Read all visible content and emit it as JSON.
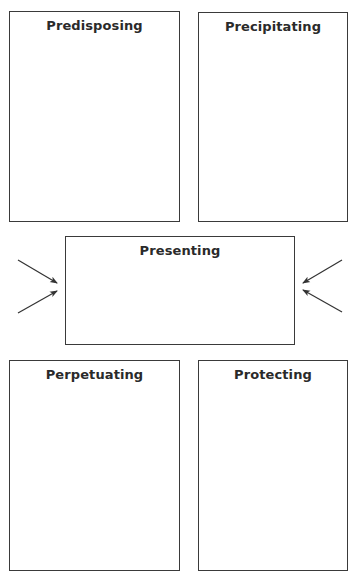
{
  "diagram": {
    "type": "5P formulation",
    "boxes": [
      {
        "id": "predisposing",
        "title": "Predisposing",
        "x": 9,
        "y": 11,
        "w": 171,
        "h": 211
      },
      {
        "id": "precipitating",
        "title": "Precipitating",
        "x": 198,
        "y": 12,
        "w": 150,
        "h": 210
      },
      {
        "id": "presenting",
        "title": "Presenting",
        "x": 65,
        "y": 236,
        "w": 230,
        "h": 109
      },
      {
        "id": "perpetuating",
        "title": "Perpetuating",
        "x": 9,
        "y": 360,
        "w": 171,
        "h": 211
      },
      {
        "id": "protecting",
        "title": "Protecting",
        "x": 198,
        "y": 360,
        "w": 150,
        "h": 211
      }
    ],
    "arrows": [
      {
        "from": "predisposing",
        "to": "presenting",
        "x1": 18,
        "y1": 260,
        "x2": 57,
        "y2": 283
      },
      {
        "from": "perpetuating",
        "to": "presenting",
        "x1": 18,
        "y1": 313,
        "x2": 57,
        "y2": 291
      },
      {
        "from": "precipitating",
        "to": "presenting",
        "x1": 342,
        "y1": 260,
        "x2": 303,
        "y2": 283
      },
      {
        "from": "protecting",
        "to": "presenting",
        "x1": 342,
        "y1": 312,
        "x2": 303,
        "y2": 290
      }
    ],
    "colors": {
      "border": "#3a3a3a",
      "title": "#2a2a2a",
      "arrow": "#333333",
      "background": "#ffffff"
    }
  }
}
